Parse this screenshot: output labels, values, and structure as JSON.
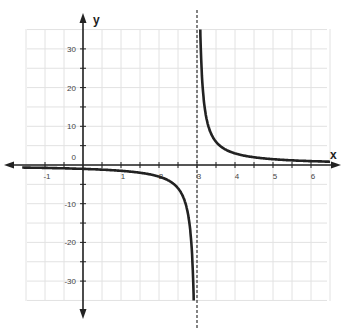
{
  "chart_data": {
    "type": "line",
    "title": "",
    "xlabel": "x",
    "ylabel": "y",
    "function": "y = 3/(x - 3)",
    "asymptote": {
      "type": "vertical",
      "x": 3,
      "style": "dashed"
    },
    "xlim": [
      -1.5,
      6.5
    ],
    "ylim": [
      -35,
      35
    ],
    "grid": true,
    "x_ticks": [
      -1,
      1,
      2,
      3,
      4,
      5,
      6
    ],
    "x_tick_labels": [
      "-1",
      "1",
      "2",
      "3",
      "4",
      "5",
      "6"
    ],
    "y_ticks": [
      30,
      20,
      10,
      0,
      -10,
      -20,
      -30
    ],
    "y_tick_labels": [
      "30",
      "20",
      "10",
      "0",
      "-10",
      "-20",
      "-30"
    ],
    "series": [
      {
        "name": "left branch",
        "x": [
          -1.5,
          -1,
          0,
          1,
          2,
          2.5,
          2.7,
          2.8,
          2.9,
          2.914
        ],
        "y": [
          -0.67,
          -0.75,
          -1,
          -1.5,
          -3,
          -6,
          -10,
          -15,
          -30,
          -35
        ]
      },
      {
        "name": "right branch",
        "x": [
          3.086,
          3.1,
          3.2,
          3.3,
          3.5,
          4,
          5,
          6,
          6.5
        ],
        "y": [
          35,
          30,
          15,
          10,
          6,
          3,
          1.5,
          1,
          0.86
        ]
      }
    ]
  }
}
